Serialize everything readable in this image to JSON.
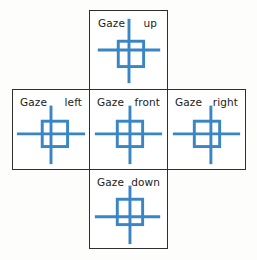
{
  "figure": {
    "background_color": "#fdfdfc",
    "line_color": "#3a86c4",
    "border_color": "#2f2f2f",
    "text_color": "#1b1b1b",
    "layout": "cross",
    "label_prefix": "Gaze"
  },
  "cells": [
    {
      "id": "up",
      "position": "top",
      "label_prefix": "Gaze",
      "label_direction": "up",
      "glyph": "eye-cross-square",
      "cross_center_x": 40,
      "cross_center_y": 40,
      "square_center_x": 42,
      "square_center_y": 44
    },
    {
      "id": "left",
      "position": "middle-left",
      "label_prefix": "Gaze",
      "label_direction": "left",
      "glyph": "eye-cross-square",
      "cross_center_x": 39,
      "cross_center_y": 45,
      "square_center_x": 43,
      "square_center_y": 45
    },
    {
      "id": "front",
      "position": "middle-center",
      "label_prefix": "Gaze",
      "label_direction": "front",
      "glyph": "eye-cross-square",
      "cross_center_x": 41,
      "cross_center_y": 45,
      "square_center_x": 41,
      "square_center_y": 45
    },
    {
      "id": "right",
      "position": "middle-right",
      "label_prefix": "Gaze",
      "label_direction": "right",
      "glyph": "eye-cross-square",
      "cross_center_x": 44,
      "cross_center_y": 45,
      "square_center_x": 40,
      "square_center_y": 45
    },
    {
      "id": "down",
      "position": "bottom",
      "label_prefix": "Gaze",
      "label_direction": "down",
      "glyph": "eye-cross-square",
      "cross_center_x": 41,
      "cross_center_y": 48,
      "square_center_x": 40,
      "square_center_y": 43
    }
  ]
}
